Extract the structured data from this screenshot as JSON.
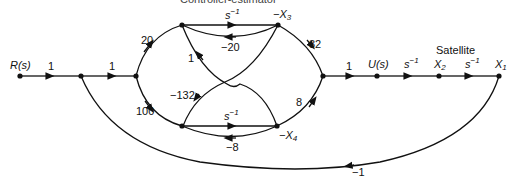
{
  "diagram": {
    "type": "signal-flow-graph",
    "caption_top": "Controller-estimator",
    "section_label": "Satellite",
    "nodes": {
      "input": "R(s)",
      "x3": "−X",
      "x3_sub": "3",
      "x4": "−X",
      "x4_sub": "4",
      "u": "U(s)",
      "x2": "X",
      "x2_sub": "2",
      "x1": "X",
      "x1_sub": "1"
    },
    "gains": {
      "r_to_n1": "1",
      "n1_to_n2": "1",
      "n2_to_upper": "20",
      "n2_to_lower": "100",
      "upper_integrator": "s",
      "upper_integrator_exp": "−1",
      "x3_feedback": "−20",
      "x3_to_lower_cross": "1",
      "x4_to_upper_cross": "−132",
      "x3_to_merge": "32",
      "x4_to_merge": "8",
      "lower_integrator": "s",
      "lower_integrator_exp": "−1",
      "x4_feedback": "−8",
      "merge_to_u": "1",
      "u_to_x2": "s",
      "u_to_x2_exp": "−1",
      "x2_to_x1": "s",
      "x2_to_x1_exp": "−1",
      "x1_feedback": "−1"
    }
  }
}
